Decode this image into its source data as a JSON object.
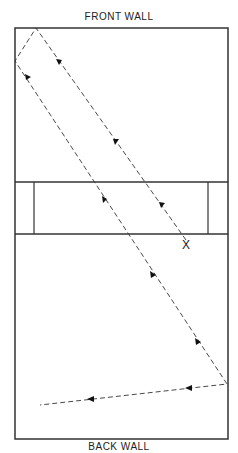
{
  "labels": {
    "front_wall": "FRONT WALL",
    "back_wall": "BACK WALL",
    "marker": "X"
  },
  "court": {
    "x": 15,
    "y": 28,
    "w": 213,
    "h": 411
  },
  "service_zone": {
    "y1": 182,
    "y2": 234,
    "box_left_x": 34,
    "box_right_x": 208
  },
  "path_points": [
    [
      186,
      243
    ],
    [
      36,
      28
    ],
    [
      15,
      61
    ],
    [
      227,
      384
    ],
    [
      40,
      405
    ]
  ],
  "colors": {
    "line": "#222222",
    "bg": "#ffffff"
  }
}
